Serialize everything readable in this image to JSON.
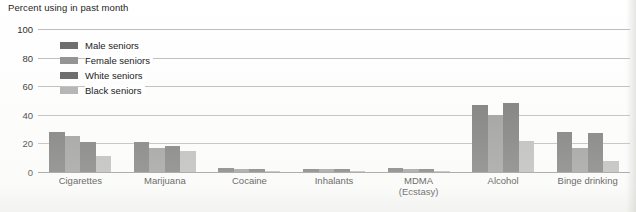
{
  "chart_data": {
    "type": "bar",
    "title": "",
    "ylabel": "Percent using in past month",
    "xlabel": "",
    "ylim": [
      0,
      100
    ],
    "yticks": [
      0,
      20,
      40,
      60,
      80,
      100
    ],
    "grid": true,
    "legend_position": "top-left-inside",
    "categories": [
      "Cigarettes",
      "Marijuana",
      "Cocaine",
      "Inhalants",
      "MDMA (Ecstasy)",
      "Alcohol",
      "Binge drinking"
    ],
    "category_lines": [
      [
        "Cigarettes"
      ],
      [
        "Marijuana"
      ],
      [
        "Cocaine"
      ],
      [
        "Inhalants"
      ],
      [
        "MDMA",
        "(Ecstasy)"
      ],
      [
        "Alcohol"
      ],
      [
        "Binge drinking"
      ]
    ],
    "series": [
      {
        "name": "Male seniors",
        "color": "#6e6e6e",
        "values": [
          28,
          21,
          3,
          2,
          3,
          47,
          28
        ]
      },
      {
        "name": "Female seniors",
        "color": "#949494",
        "values": [
          25,
          17,
          2,
          2,
          2,
          40,
          17
        ]
      },
      {
        "name": "White seniors",
        "color": "#6e6e6e",
        "values": [
          21,
          18,
          2,
          2,
          2,
          48,
          27
        ]
      },
      {
        "name": "Black seniors",
        "color": "#b6b6b6",
        "values": [
          11,
          15,
          1,
          1,
          1,
          22,
          8
        ]
      }
    ]
  },
  "axis": {
    "title": "Percent using in past month",
    "tick_100": "100",
    "tick_80": "80",
    "tick_60": "60",
    "tick_40": "40",
    "tick_20": "20",
    "tick_0": "0"
  },
  "legend": {
    "items": [
      {
        "label": "Male seniors",
        "color": "#6e6e6e"
      },
      {
        "label": "Female seniors",
        "color": "#949494"
      },
      {
        "label": "White seniors",
        "color": "#6e6e6e"
      },
      {
        "label": "Black seniors",
        "color": "#b6b6b6"
      }
    ]
  }
}
